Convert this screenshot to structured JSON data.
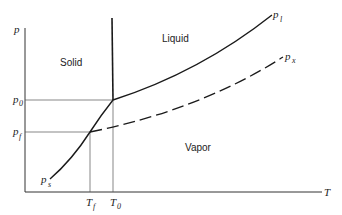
{
  "diagram": {
    "type": "phase-diagram",
    "axes": {
      "y_label": "p",
      "x_label": "T"
    },
    "regions": {
      "solid": "Solid",
      "liquid": "Liquid",
      "vapor": "Vapor"
    },
    "curves": {
      "liquid_vapor": {
        "label": "p",
        "subscript": "l"
      },
      "supercooled": {
        "label": "p",
        "subscript": "x"
      },
      "solid_vapor": {
        "label": "p",
        "subscript": "s"
      }
    },
    "ticks": {
      "p0": {
        "label": "p",
        "subscript": "0"
      },
      "pf": {
        "label": "p",
        "subscript": "f"
      },
      "Tf": {
        "label": "T",
        "subscript": "f"
      },
      "T0": {
        "label": "T",
        "subscript": "0"
      }
    },
    "colors": {
      "line": "#1a1a1a",
      "background": "#ffffff"
    }
  }
}
